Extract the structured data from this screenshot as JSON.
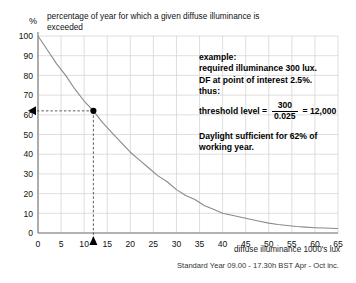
{
  "chart_data": {
    "type": "line",
    "title": "percentage of year for which a given diffuse illuminance is exceeded",
    "xlabel": "diffuse illuminance 1000's lux",
    "ylabel": "%",
    "xlim": [
      0,
      65
    ],
    "ylim": [
      0,
      100
    ],
    "xticks": [
      0,
      5,
      10,
      15,
      20,
      25,
      30,
      35,
      40,
      45,
      50,
      55,
      60,
      65
    ],
    "yticks": [
      0,
      10,
      20,
      30,
      40,
      50,
      60,
      70,
      80,
      90,
      100
    ],
    "grid": true,
    "legend": "none",
    "caption": "Standard Year 09.00 - 17.30h BST Apr - Oct inc.",
    "series": [
      {
        "name": "diffuse illuminance availability",
        "x": [
          0,
          2,
          4,
          6,
          8,
          10,
          12,
          14,
          16,
          18,
          20,
          22,
          24,
          26,
          28,
          30,
          32,
          34,
          36,
          38,
          40,
          42,
          44,
          46,
          48,
          50,
          52,
          54,
          56,
          58,
          60,
          62,
          65
        ],
        "y": [
          100,
          93,
          86,
          80,
          73,
          67,
          62,
          56,
          51,
          46,
          41,
          37,
          33,
          29,
          26,
          22,
          19,
          17,
          14,
          12,
          10,
          9,
          8,
          7,
          6,
          5,
          4.3,
          3.8,
          3.3,
          3,
          2.7,
          2.5,
          2.3
        ]
      }
    ],
    "annotations": [
      {
        "name": "worked-example-point",
        "x": 12,
        "y": 62,
        "marker": "filled-circle",
        "guide_x": "dashed vertical to x-axis with up-arrow",
        "guide_y": "dashed horizontal to y-axis with left-arrow"
      }
    ]
  },
  "notes": {
    "example_heading": "example:",
    "example_line1": "required illuminance 300 lux.",
    "example_line2": "DF at point of interest  2.5%.",
    "example_line3": "thus:",
    "formula_label": "threshold level =",
    "formula_numerator": "300",
    "formula_denominator": "0.025",
    "formula_equals": "= 12,000",
    "conclusion_line1": "Daylight sufficient for 62% of",
    "conclusion_line2": "working year."
  },
  "colors": {
    "curve": "#8a8a8a",
    "grid": "#d5d5d5",
    "axis": "#777777",
    "marker": "#000000",
    "guide": "#4a4a4a",
    "text": "#111111"
  }
}
